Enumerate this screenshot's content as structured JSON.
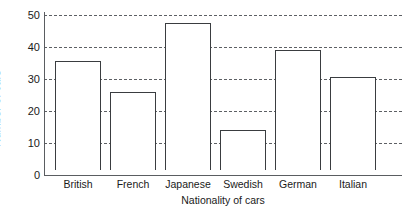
{
  "chart_data": {
    "type": "bar",
    "title": "",
    "xlabel": "Nationality of cars",
    "ylabel": "Number of cars",
    "categories": [
      "British",
      "French",
      "Japanese",
      "Swedish",
      "German",
      "Italian"
    ],
    "values": [
      34,
      24.5,
      46,
      12.5,
      37.5,
      29
    ],
    "ylim": [
      0,
      50
    ],
    "ytick_labels": [
      "0",
      "10",
      "20",
      "30",
      "40",
      "50"
    ],
    "ytick_values": [
      0,
      10,
      20,
      30,
      40,
      50
    ],
    "grid": "horizontal-dashed",
    "legend": "none",
    "bar_fill_color": "#ffffff",
    "bar_edge_color": "#3a3d40",
    "gridline_color": "#55585c",
    "axis_color": "#5a5d61",
    "text_color": "#1a1a1a",
    "background_color": "#ffffff"
  }
}
